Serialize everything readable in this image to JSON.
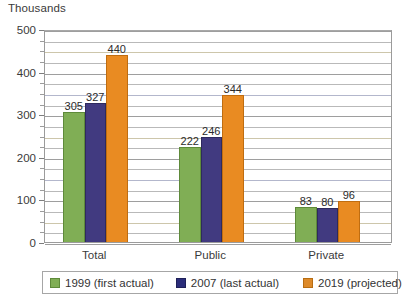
{
  "chart_data": {
    "type": "bar",
    "title": "",
    "unit_caption": "Thousands",
    "xlabel": "",
    "ylabel": "Thousands",
    "categories": [
      "Total",
      "Public",
      "Private"
    ],
    "series": [
      {
        "name": "1999 (first actual)",
        "color": "#80ae55",
        "values": [
          305,
          222,
          83
        ]
      },
      {
        "name": "2007 (last actual)",
        "color": "#413a80",
        "values": [
          327,
          246,
          80
        ]
      },
      {
        "name": "2019 (projected)",
        "color": "#e98b22",
        "values": [
          440,
          344,
          96
        ]
      }
    ],
    "ylim": [
      0,
      500
    ],
    "ytick_labels": [
      "0",
      "100",
      "200",
      "300",
      "400",
      "500"
    ],
    "ytick_values": [
      0,
      100,
      200,
      300,
      400,
      500
    ],
    "minor_gridline_step": 25,
    "grid": true,
    "legend_position": "bottom",
    "data_labels": true
  },
  "legend": {
    "items": [
      {
        "label": "1999 (first actual)"
      },
      {
        "label": "2007 (last actual)"
      },
      {
        "label": "2019 (projected)"
      }
    ]
  }
}
